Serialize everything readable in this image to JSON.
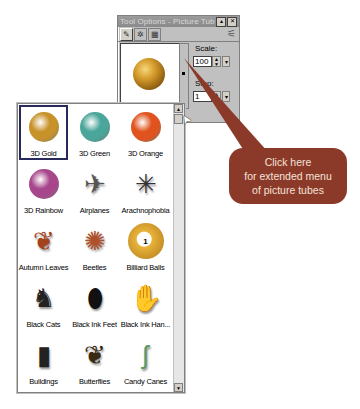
{
  "window": {
    "title": "Tool Options - Picture Tube",
    "minimize_icon": "minimize-icon",
    "close_icon": "close-icon",
    "tabs": [
      {
        "icon": "picture-tube-icon",
        "glyph": "✎"
      },
      {
        "icon": "options-icon",
        "glyph": "✲"
      },
      {
        "icon": "image-icon",
        "glyph": "▦"
      }
    ],
    "pin_glyph": "⚟",
    "preview_item": "3D Gold",
    "scale_label": "Scale:",
    "scale_value": "100",
    "step_label": "Step:",
    "step_value": "1",
    "spin_up_glyph": "▲",
    "spin_down_glyph": "▼",
    "dropdown_glyph": "▾"
  },
  "tubes_panel": {
    "selected": "3D Gold",
    "items": [
      {
        "label": "3D Gold",
        "kind": "sphere",
        "color": "#c8922a"
      },
      {
        "label": "3D Green",
        "kind": "sphere",
        "color": "#4aa59a"
      },
      {
        "label": "3D Orange",
        "kind": "sphere",
        "color": "#e0531e"
      },
      {
        "label": "3D Rainbow",
        "kind": "sphere",
        "color": "#a8468c"
      },
      {
        "label": "Airplanes",
        "kind": "glyph",
        "glyph": "✈",
        "color": "#555555"
      },
      {
        "label": "Arachnophobia",
        "kind": "glyph",
        "glyph": "✳",
        "color": "#333333"
      },
      {
        "label": "Autumn Leaves",
        "kind": "glyph",
        "glyph": "❦",
        "color": "#a4421c"
      },
      {
        "label": "Beetles",
        "kind": "glyph",
        "glyph": "✺",
        "color": "#b0502a"
      },
      {
        "label": "Billiard Balls",
        "kind": "billiard",
        "color": "#e8b23a",
        "number": "1"
      },
      {
        "label": "Black Cats",
        "kind": "glyph",
        "glyph": "♞",
        "color": "#222222"
      },
      {
        "label": "Black Ink Feet",
        "kind": "glyph",
        "glyph": "⬮",
        "color": "#111111"
      },
      {
        "label": "Black Ink Han...",
        "kind": "glyph",
        "glyph": "✋",
        "color": "#111111"
      },
      {
        "label": "Buildings",
        "kind": "glyph",
        "glyph": "▮",
        "color": "#222222"
      },
      {
        "label": "Butterflies",
        "kind": "glyph",
        "glyph": "❦",
        "color": "#3a2a10"
      },
      {
        "label": "Candy Canes",
        "kind": "glyph",
        "glyph": "ʃ",
        "color": "#5a9a6a"
      }
    ],
    "scroll_up_glyph": "▲",
    "scroll_down_glyph": "▼"
  },
  "callout": {
    "lines": [
      "Click here",
      "for extended menu",
      "of picture tubes"
    ],
    "color": "#8b3a2a"
  },
  "cursor_glyph": "➤"
}
